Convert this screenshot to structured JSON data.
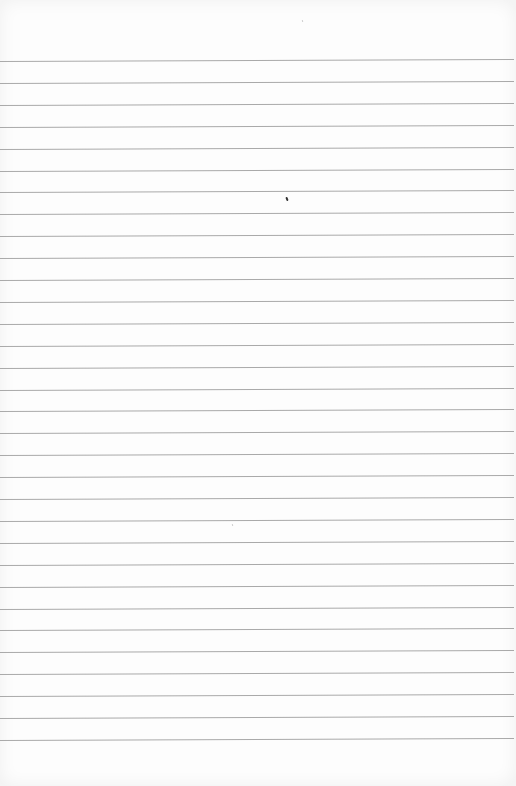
{
  "page": {
    "type": "blank ruled notebook page",
    "paper_color": "#fdfdfd",
    "rule_color": "#a9a9a9",
    "rule_count": 32,
    "first_rule_y": 61,
    "rule_spacing": 21.9
  },
  "marks": [
    {
      "x": 286,
      "y": 197,
      "kind": "dark-speck"
    },
    {
      "x": 302,
      "y": 20,
      "kind": "faint-speck"
    },
    {
      "x": 232,
      "y": 524,
      "kind": "faint-speck"
    }
  ],
  "text": ""
}
